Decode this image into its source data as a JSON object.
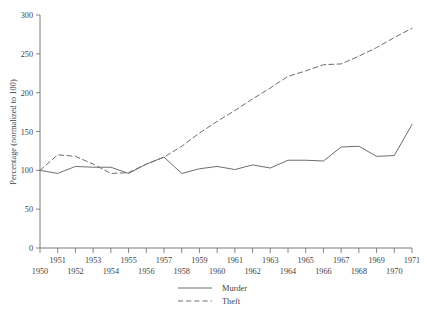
{
  "chart_data": {
    "type": "line",
    "title": "",
    "subtitle": "",
    "xlabel": "",
    "ylabel": "Percentage (normalized to 100)",
    "xlim": [
      1950,
      1971
    ],
    "ylim": [
      0,
      300
    ],
    "grid": false,
    "legend_position": "bottom-center",
    "x": [
      1950,
      1951,
      1952,
      1953,
      1954,
      1955,
      1956,
      1957,
      1958,
      1959,
      1960,
      1961,
      1962,
      1963,
      1964,
      1965,
      1966,
      1967,
      1968,
      1969,
      1970,
      1971
    ],
    "xtick_labels_upper": [
      "1951",
      "1953",
      "1955",
      "1957",
      "1959",
      "1961",
      "1963",
      "1965",
      "1967",
      "1969",
      "1971"
    ],
    "xtick_labels_lower": [
      "1950",
      "1952",
      "1954",
      "1956",
      "1958",
      "1960",
      "1962",
      "1964",
      "1966",
      "1968",
      "1970"
    ],
    "ytick_labels": [
      "0",
      "50",
      "100",
      "150",
      "200",
      "250",
      "300"
    ],
    "ytick_values": [
      0,
      50,
      100,
      150,
      200,
      250,
      300
    ],
    "series": [
      {
        "name": "Murder",
        "style": "solid",
        "color": "#6e6e6e",
        "values": [
          100,
          96,
          105,
          104,
          104,
          96,
          108,
          117,
          96,
          102,
          105,
          101,
          107,
          103,
          113,
          113,
          112,
          130,
          131,
          118,
          119,
          159
        ]
      },
      {
        "name": "Theft",
        "style": "dashed",
        "color": "#6e6e6e",
        "values": [
          100,
          120,
          118,
          108,
          96,
          97,
          108,
          117,
          131,
          148,
          163,
          177,
          192,
          206,
          221,
          228,
          236,
          237,
          247,
          258,
          271,
          283
        ]
      }
    ]
  },
  "legend": {
    "entries": [
      {
        "label": "Murder",
        "style": "solid"
      },
      {
        "label": "Theft",
        "style": "dashed"
      }
    ]
  }
}
